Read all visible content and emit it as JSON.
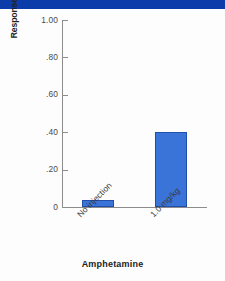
{
  "figure": {
    "header_bar_color": "#0c3caa",
    "background_color": "#fdfdfd",
    "axis_color": "#8c8c8c"
  },
  "chart_data": {
    "type": "bar",
    "title": "",
    "subtitle": "",
    "xlabel": "Amphetamine",
    "ylabel": "Responses (in seconds)",
    "categories": [
      "No injection",
      "1.0 mg/kg"
    ],
    "values": [
      0.04,
      0.4
    ],
    "series": [
      {
        "name": "Responses",
        "values": [
          0.04,
          0.4
        ],
        "color": "#3a74d9"
      }
    ],
    "ylim": [
      0,
      1.0
    ],
    "ytick_values": [
      1.0,
      0.8,
      0.6,
      0.4,
      0.2,
      0
    ],
    "ytick_labels": [
      "1.00",
      ".80",
      ".60",
      ".40",
      ".20",
      "0"
    ],
    "grid": false,
    "legend": false,
    "legend_position": "none",
    "bar_color": "#3a74d9",
    "bar_edge_color": "#1f4fa8",
    "xtick_label_rotation": -45
  }
}
